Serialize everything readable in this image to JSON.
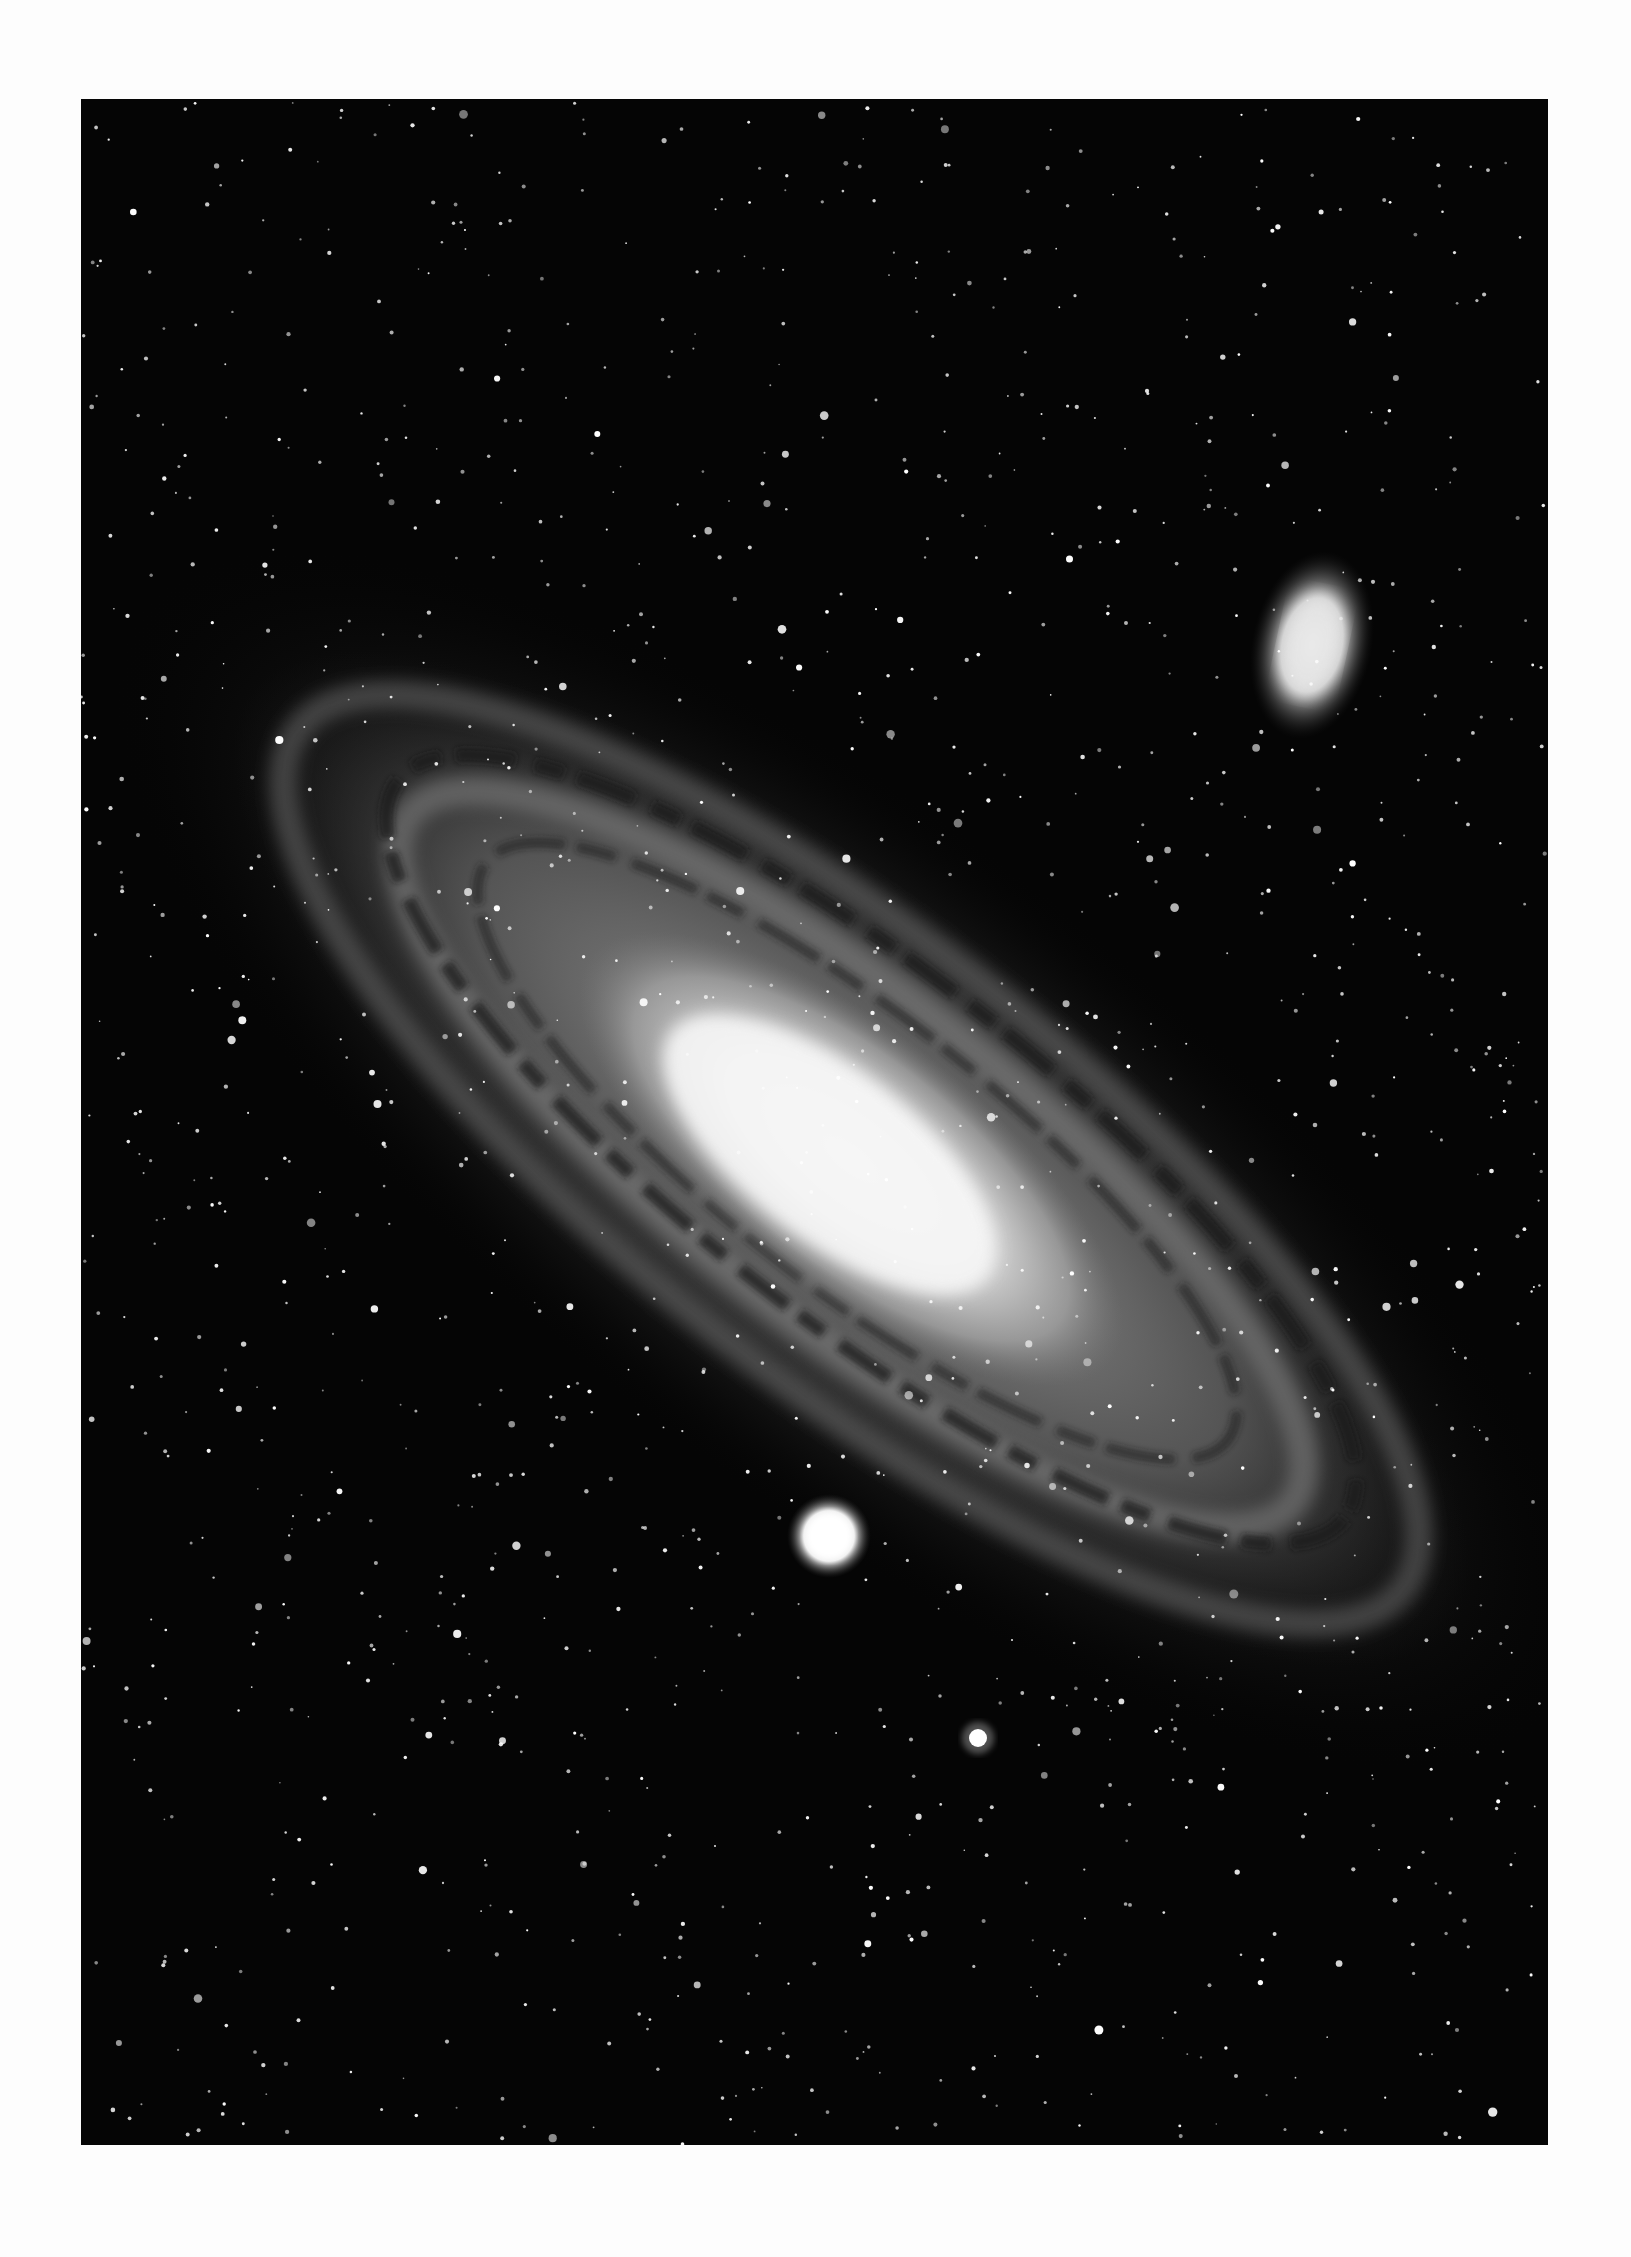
{
  "image": {
    "subject": "Andromeda galaxy photograph",
    "style": "black-and-white astrophotograph",
    "colors": {
      "page_background": "#fdfdfd",
      "sky": "#050505",
      "core": "#f4f4f4",
      "star": "#ffffff"
    },
    "frame": {
      "left": 81,
      "top": 99,
      "width": 1467,
      "height": 2046
    },
    "objects": [
      {
        "name": "main-galaxy",
        "label": "spiral galaxy",
        "center": [
          770,
          1060
        ],
        "tilt_deg": 38
      },
      {
        "name": "upper-right-satellite",
        "label": "elliptical companion galaxy",
        "center": [
          1312,
          645
        ]
      },
      {
        "name": "lower-satellite",
        "label": "compact companion galaxy",
        "center": [
          829,
          1536
        ]
      },
      {
        "name": "bright-star",
        "center": [
          978,
          1738
        ]
      }
    ]
  }
}
